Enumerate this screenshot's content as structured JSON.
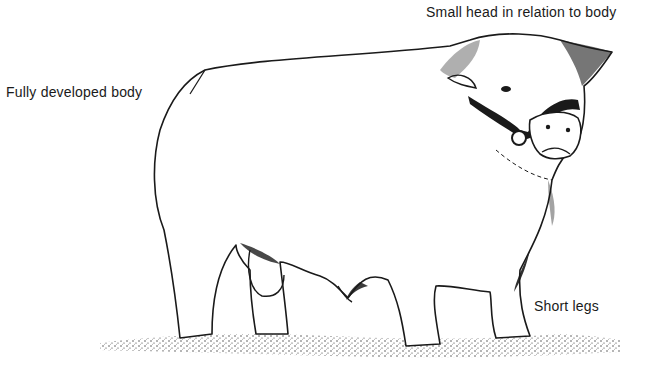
{
  "figure": {
    "labels": {
      "head": "Small head in relation to body",
      "body": "Fully developed body",
      "legs": "Short legs"
    },
    "colors": {
      "ink": "#1a1a1a",
      "background": "#ffffff"
    }
  }
}
